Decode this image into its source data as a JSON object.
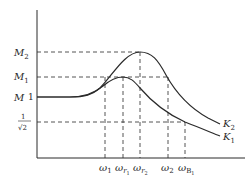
{
  "diagram": {
    "type": "frequency-response",
    "axes": {
      "y_label": "M",
      "x_label": ""
    },
    "y_ticks": {
      "M2": {
        "main": "M",
        "sub": "2"
      },
      "M1": {
        "main": "M",
        "sub": "1"
      },
      "one": "1",
      "inv_sqrt2_num": "1",
      "inv_sqrt2_den": "√2"
    },
    "x_ticks": {
      "w1": {
        "main": "ω",
        "sub": "1"
      },
      "wr1": {
        "main": "ω",
        "sub": "r",
        "subsub": "1"
      },
      "wr2": {
        "main": "ω",
        "sub": "r",
        "subsub": "2"
      },
      "w2": {
        "main": "ω",
        "sub": "2"
      },
      "wB1": {
        "main": "ω",
        "sub": "B",
        "subsub": "1"
      }
    },
    "curves": [
      {
        "name": "K2",
        "label_main": "K",
        "label_sub": "2",
        "peak": "M2",
        "peak_freq": "ωr2"
      },
      {
        "name": "K1",
        "label_main": "K",
        "label_sub": "1",
        "peak": "M1",
        "peak_freq": "ωr1"
      }
    ],
    "colors": {
      "line": "#2a2a2a",
      "background": "#ffffff"
    }
  }
}
